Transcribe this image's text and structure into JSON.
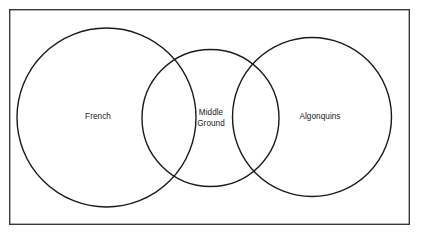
{
  "figure": {
    "background_color": "#ffffff",
    "frame": {
      "stroke_color": "#3a3a3a",
      "stroke_width": 1.4,
      "x": 9,
      "y": 9,
      "width": 401,
      "height": 216
    },
    "stroke_color": "#1a1a1a",
    "text_color": "#1a1a1a"
  },
  "chart_data": {
    "type": "diagram",
    "diagram_type": "venn",
    "title": "",
    "set_count": 3,
    "sets": [
      {
        "id": "french",
        "label": "French",
        "label_lines": [
          "French"
        ],
        "cx": 106.5,
        "cy": 117.5,
        "r": 90,
        "label_x": 98,
        "label_y": 117
      },
      {
        "id": "middle-ground",
        "label": "Middle Ground",
        "label_lines": [
          "Middle",
          "Ground"
        ],
        "cx": 210.5,
        "cy": 118,
        "r": 69,
        "label_x": 211,
        "label_y": 118
      },
      {
        "id": "algonquins",
        "label": "Algonquins",
        "label_lines": [
          "Algonquins"
        ],
        "cx": 312,
        "cy": 117,
        "r": 80,
        "label_x": 320,
        "label_y": 117
      }
    ],
    "overlaps": [
      {
        "between": [
          "french",
          "middle-ground"
        ],
        "label": ""
      },
      {
        "between": [
          "middle-ground",
          "algonquins"
        ],
        "label": ""
      }
    ],
    "grid": false,
    "legend": "none"
  }
}
